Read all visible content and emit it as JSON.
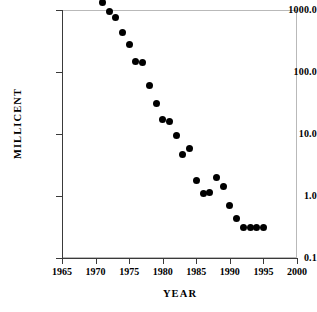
{
  "chart_data": {
    "type": "scatter",
    "title": "",
    "xlabel": "YEAR",
    "ylabel": "MILLICENT",
    "xlim": [
      1965,
      2000
    ],
    "ylim": [
      0.1,
      1000.0
    ],
    "yscale": "log",
    "xscale": "linear",
    "grid": false,
    "legend": null,
    "xticks": [
      1965,
      1970,
      1975,
      1980,
      1985,
      1990,
      1995,
      2000
    ],
    "xtick_labels": [
      "1965",
      "1970",
      "1975",
      "1980",
      "1985",
      "1990",
      "1995",
      "2000"
    ],
    "yticks": [
      0.1,
      1.0,
      10.0,
      100.0,
      1000.0
    ],
    "ytick_labels": [
      "0.1",
      "1.0",
      "10.0",
      "100.0",
      "1000.0"
    ],
    "marker": "filled-circle",
    "marker_color": "#000000",
    "points": [
      {
        "x": 1971,
        "y": 1300
      },
      {
        "x": 1972,
        "y": 950
      },
      {
        "x": 1973,
        "y": 760
      },
      {
        "x": 1974,
        "y": 440
      },
      {
        "x": 1975,
        "y": 280
      },
      {
        "x": 1976,
        "y": 150
      },
      {
        "x": 1977,
        "y": 140
      },
      {
        "x": 1978,
        "y": 60
      },
      {
        "x": 1979,
        "y": 31
      },
      {
        "x": 1980,
        "y": 17
      },
      {
        "x": 1981,
        "y": 16
      },
      {
        "x": 1982,
        "y": 9.5
      },
      {
        "x": 1983,
        "y": 4.6
      },
      {
        "x": 1984,
        "y": 5.8
      },
      {
        "x": 1985,
        "y": 1.8
      },
      {
        "x": 1986,
        "y": 1.1
      },
      {
        "x": 1987,
        "y": 1.12
      },
      {
        "x": 1988,
        "y": 2.0
      },
      {
        "x": 1989,
        "y": 1.4
      },
      {
        "x": 1990,
        "y": 0.7
      },
      {
        "x": 1991,
        "y": 0.43
      },
      {
        "x": 1992,
        "y": 0.31
      },
      {
        "x": 1993,
        "y": 0.31
      },
      {
        "x": 1994,
        "y": 0.31
      },
      {
        "x": 1995,
        "y": 0.31
      }
    ]
  },
  "axes": {
    "y_title": "MILLICENT",
    "x_title": "YEAR"
  }
}
